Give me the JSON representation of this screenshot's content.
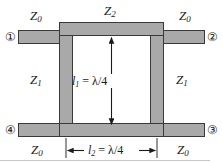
{
  "figure": {
    "type": "branch-line-coupler-schematic",
    "background_color": "#ffffff",
    "conductor_color": "#a9a9a9",
    "outline_color": "#3a3a3a",
    "text_color": "#1a1a1a"
  },
  "impedance_labels": {
    "top_left": {
      "symbol": "Z",
      "sub": "0"
    },
    "top_center": {
      "symbol": "Z",
      "sub": "2"
    },
    "top_right": {
      "symbol": "Z",
      "sub": "0"
    },
    "left_arm": {
      "symbol": "Z",
      "sub": "1"
    },
    "right_arm": {
      "symbol": "Z",
      "sub": "1"
    },
    "bottom_left": {
      "symbol": "Z",
      "sub": "0"
    },
    "bottom_right": {
      "symbol": "Z",
      "sub": "0"
    }
  },
  "ports": {
    "port1": "①",
    "port2": "②",
    "port3": "③",
    "port4": "④"
  },
  "dimensions": {
    "vertical": {
      "symbol": "l",
      "sub": "1",
      "value": "= λ/4"
    },
    "horizontal": {
      "symbol": "l",
      "sub": "2",
      "value": "= λ/4"
    }
  }
}
